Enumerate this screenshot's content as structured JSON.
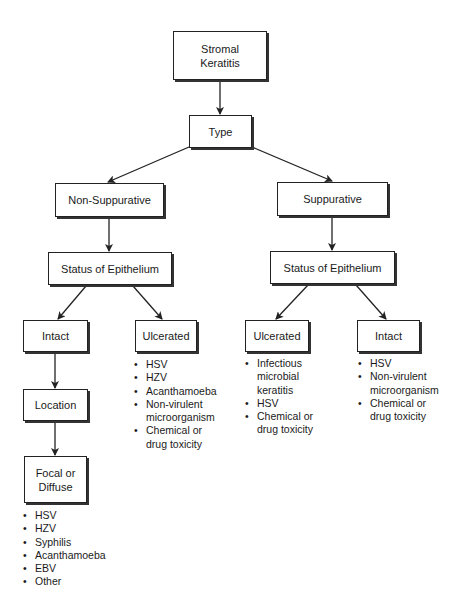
{
  "diagram": {
    "title": "Stromal Keratitis",
    "nodes": {
      "root": "Stromal\nKeratitis",
      "type": "Type",
      "non_suppurative": "Non-Suppurative",
      "suppurative": "Suppurative",
      "status_left": "Status of Epithelium",
      "status_right": "Status of Epithelium",
      "intact_left": "Intact",
      "ulcerated_left": "Ulcerated",
      "ulcerated_right": "Ulcerated",
      "intact_right": "Intact",
      "location": "Location",
      "focal_diffuse": "Focal or\nDiffuse"
    },
    "lists": {
      "ulcerated_left": [
        "HSV",
        "HZV",
        "Acanthamoeba",
        "Non-virulent\nmicroorganism",
        "Chemical or\ndrug toxicity"
      ],
      "ulcerated_right": [
        "Infectious\nmicrobial\nkeratitis",
        "HSV",
        "Chemical or\ndrug toxicity"
      ],
      "intact_right": [
        "HSV",
        "Non-virulent\nmicroorganism",
        "Chemical or\ndrug toxicity"
      ],
      "focal_diffuse": [
        "HSV",
        "HZV",
        "Syphilis",
        "Acanthamoeba",
        "EBV",
        "Other"
      ]
    },
    "edges": [
      [
        "root",
        "type"
      ],
      [
        "type",
        "non_suppurative"
      ],
      [
        "type",
        "suppurative"
      ],
      [
        "non_suppurative",
        "status_left"
      ],
      [
        "suppurative",
        "status_right"
      ],
      [
        "status_left",
        "intact_left"
      ],
      [
        "status_left",
        "ulcerated_left"
      ],
      [
        "status_right",
        "ulcerated_right"
      ],
      [
        "status_right",
        "intact_right"
      ],
      [
        "intact_left",
        "location"
      ],
      [
        "location",
        "focal_diffuse"
      ]
    ],
    "colors": {
      "line": "#222222",
      "background": "#ffffff"
    }
  }
}
